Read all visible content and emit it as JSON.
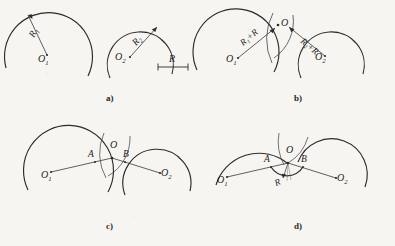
{
  "figure": {
    "background_color": "#f6f5f2",
    "ink_color": "#2b2b2b"
  },
  "panels": [
    {
      "id": "a",
      "caption": "a)",
      "description": "Two given circular arcs with centres O1, O2 and radii R1, R2, plus the required fillet radius R shown as a dimension bar.",
      "labels": {
        "center_1": "O",
        "center_1_sub": "1",
        "center_2": "O",
        "center_2_sub": "2",
        "radius_1": "R",
        "radius_1_sub": "1",
        "radius_2": "R",
        "radius_2_sub": "2",
        "scale_bar": "R"
      }
    },
    {
      "id": "b",
      "caption": "b)",
      "description": "Auxiliary arcs of radii R1+R about O1 and R2+R about O2 intersect at point O, the centre of the fillet.",
      "labels": {
        "center_1": "O",
        "center_1_sub": "1",
        "center_2": "O",
        "center_2_sub": "2",
        "radius_sum_1": "R₁+R",
        "radius_sum_2": "R₂+R",
        "intersection": "O"
      }
    },
    {
      "id": "c",
      "caption": "c)",
      "description": "Straight lines joining O1 to O and O2 to O cut the given arcs at the tangent points A and B.",
      "labels": {
        "center_1": "O",
        "center_1_sub": "1",
        "center_2": "O",
        "center_2_sub": "2",
        "intersection": "O",
        "tangent_point_a": "A",
        "tangent_point_b": "B"
      }
    },
    {
      "id": "d",
      "caption": "d)",
      "description": "The fillet arc of radius R is drawn from A to B about centre O, completing the smooth junction.",
      "labels": {
        "center_1": "O",
        "center_1_sub": "1",
        "center_2": "O",
        "center_2_sub": "2",
        "intersection": "O",
        "tangent_point_a": "A",
        "tangent_point_b": "B",
        "fillet_radius": "R"
      }
    }
  ]
}
